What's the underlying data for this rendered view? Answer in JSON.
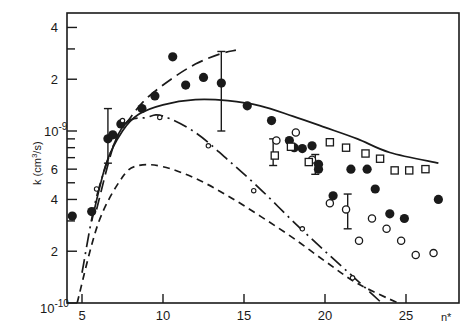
{
  "chart_data": {
    "type": "scatter",
    "title": "",
    "xlabel": "n*",
    "ylabel": "k (cm3/s)",
    "xlim": [
      4.1,
      27.7
    ],
    "ylim": [
      1e-10,
      4.9e-09
    ],
    "yscale": "log",
    "grid": false,
    "legend": null,
    "x_ticks": [
      5,
      10,
      15,
      20,
      25
    ],
    "x_tick_labels": [
      "5",
      "10",
      "15",
      "20",
      "25"
    ],
    "y_tick_labels": [
      {
        "value": 1e-10,
        "label": "10",
        "exp": "-10"
      },
      {
        "value": 2e-10,
        "label": "2"
      },
      {
        "value": 4e-10,
        "label": "4"
      },
      {
        "value": 6e-10,
        "label": "6"
      },
      {
        "value": 1e-09,
        "label": "10",
        "exp": "-9"
      },
      {
        "value": 2e-09,
        "label": "2"
      },
      {
        "value": 4e-09,
        "label": "4"
      }
    ],
    "series": [
      {
        "name": "filled circles",
        "marker": "filled-circle",
        "points": [
          [
            4.4,
            3.2e-10
          ],
          [
            5.6,
            3.4e-10
          ],
          [
            6.6,
            9e-10
          ],
          [
            7.4,
            1.1e-09
          ],
          [
            8.7,
            1.35e-09
          ],
          [
            9.5,
            1.6e-09
          ],
          [
            10.6,
            2.7e-09
          ],
          [
            11.4,
            1.85e-09
          ],
          [
            12.5,
            2.05e-09
          ],
          [
            13.6,
            1.9e-09
          ],
          [
            15.2,
            1.4e-09
          ],
          [
            16.7,
            1.15e-09
          ],
          [
            17.8,
            8.8e-10
          ],
          [
            18.1,
            8e-10
          ],
          [
            19.6,
            6e-10
          ],
          [
            19.6,
            6.4e-10
          ],
          [
            21.6,
            6e-10
          ],
          [
            20.5,
            4.2e-10
          ],
          [
            22.6,
            6e-10
          ],
          [
            23.1,
            4.6e-10
          ],
          [
            24.0,
            3.3e-10
          ],
          [
            24.9,
            3.1e-10
          ],
          [
            27.0,
            4e-10
          ],
          [
            6.9,
            9.5e-10
          ],
          [
            18.6,
            7.9e-10
          ],
          [
            19.2,
            8.2e-10
          ]
        ]
      },
      {
        "name": "open circles",
        "marker": "open-circle",
        "points": [
          [
            17.0,
            8.8e-10
          ],
          [
            18.2,
            9.8e-10
          ],
          [
            19.2,
            6.8e-10
          ],
          [
            20.3,
            3.8e-10
          ],
          [
            21.3,
            3.5e-10
          ],
          [
            22.1,
            2.3e-10
          ],
          [
            22.9,
            3.1e-10
          ],
          [
            23.8,
            2.7e-10
          ],
          [
            24.7,
            2.3e-10
          ],
          [
            25.6,
            1.9e-10
          ],
          [
            26.7,
            1.95e-10
          ]
        ]
      },
      {
        "name": "open squares",
        "marker": "open-square",
        "points": [
          [
            16.9,
            7.2e-10
          ],
          [
            17.9,
            8.1e-10
          ],
          [
            19.0,
            6.6e-10
          ],
          [
            20.3,
            8.6e-10
          ],
          [
            21.3,
            8e-10
          ],
          [
            22.5,
            7.4e-10
          ],
          [
            23.4,
            6.9e-10
          ],
          [
            24.3,
            5.9e-10
          ],
          [
            25.2,
            5.9e-10
          ],
          [
            26.2,
            6e-10
          ]
        ]
      },
      {
        "name": "small open circles (on dash-dot curve)",
        "marker": "small-open-circle",
        "points": [
          [
            5.9,
            4.6e-10
          ],
          [
            7.5,
            1.15e-09
          ],
          [
            9.8,
            1.2e-09
          ],
          [
            12.8,
            8.2e-10
          ],
          [
            15.6,
            4.5e-10
          ],
          [
            18.6,
            2.7e-10
          ],
          [
            21.7,
            1.4e-10
          ]
        ]
      }
    ],
    "error_bars": [
      {
        "x": 6.6,
        "low": 6.5e-10,
        "high": 1.35e-09
      },
      {
        "x": 13.6,
        "low": 1e-09,
        "high": 2.9e-09
      },
      {
        "x": 16.8,
        "low": 6.3e-10,
        "high": 9e-10
      },
      {
        "x": 19.4,
        "low": 5.6e-10,
        "high": 7.3e-10
      },
      {
        "x": 21.4,
        "low": 2.7e-10,
        "high": 4.3e-10
      }
    ],
    "curves": [
      {
        "name": "solid curve",
        "style": "solid",
        "points": [
          [
            5.6,
            3e-10
          ],
          [
            6.5,
            6.5e-10
          ],
          [
            7.5,
            1e-09
          ],
          [
            8.5,
            1.25e-09
          ],
          [
            10,
            1.42e-09
          ],
          [
            12,
            1.52e-09
          ],
          [
            14,
            1.5e-09
          ],
          [
            16,
            1.4e-09
          ],
          [
            18,
            1.22e-09
          ],
          [
            20,
            1.05e-09
          ],
          [
            22,
            9e-10
          ],
          [
            24,
            7.5e-10
          ],
          [
            27,
            6.5e-10
          ]
        ]
      },
      {
        "name": "long-dash curve (upper)",
        "style": "long-dash",
        "points": [
          [
            5.9,
            3.5e-10
          ],
          [
            7.0,
            8.5e-10
          ],
          [
            8.0,
            1.2e-09
          ],
          [
            9.0,
            1.55e-09
          ],
          [
            10.5,
            2e-09
          ],
          [
            12.0,
            2.45e-09
          ],
          [
            13.5,
            2.8e-09
          ],
          [
            14.5,
            2.95e-09
          ]
        ]
      },
      {
        "name": "dash-dot curve",
        "style": "dash-dot",
        "points": [
          [
            5.0,
            1.5e-10
          ],
          [
            6.0,
            4.5e-10
          ],
          [
            7.5,
            1.05e-09
          ],
          [
            9.0,
            1.2e-09
          ],
          [
            10.0,
            1.22e-09
          ],
          [
            12.0,
            9.8e-10
          ],
          [
            14.0,
            6.8e-10
          ],
          [
            16.0,
            4.6e-10
          ],
          [
            18.0,
            3e-10
          ],
          [
            20.0,
            2e-10
          ],
          [
            22.0,
            1.35e-10
          ],
          [
            23.5,
            1e-10
          ]
        ]
      },
      {
        "name": "short-dash curve (lower)",
        "style": "short-dash",
        "points": [
          [
            4.7,
            1e-10
          ],
          [
            6.0,
            2.9e-10
          ],
          [
            7.5,
            5.4e-10
          ],
          [
            8.5,
            6.3e-10
          ],
          [
            10.0,
            6.2e-10
          ],
          [
            12.0,
            5.3e-10
          ],
          [
            14.0,
            4.2e-10
          ],
          [
            16.0,
            3.2e-10
          ],
          [
            18.0,
            2.4e-10
          ],
          [
            20.0,
            1.75e-10
          ],
          [
            22.0,
            1.3e-10
          ],
          [
            24.5,
            1e-10
          ]
        ]
      }
    ]
  },
  "axes": {
    "xlabel": "n*",
    "ylabel_prefix": "k (cm",
    "ylabel_sup": "3",
    "ylabel_suffix": "/s)"
  }
}
